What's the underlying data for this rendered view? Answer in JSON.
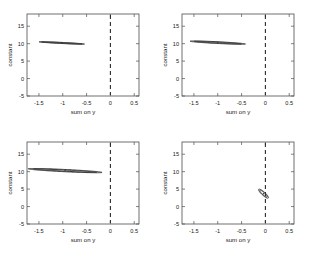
{
  "figure": {
    "title": "",
    "background_color": "#ffffff",
    "layout": "2x2 grid of confidence-ellipse scatter panels"
  },
  "chart_data": [
    {
      "type": "scatter",
      "panel": "top-left",
      "title": "",
      "xlabel": "sum on y",
      "ylabel": "constant",
      "xlim": [
        -1.75,
        0.6
      ],
      "ylim": [
        -5,
        18.5
      ],
      "xticks": [
        -1.5,
        -1,
        -0.5,
        0,
        0.5
      ],
      "xticklabels": [
        "-1.5",
        "-1",
        "-0.5",
        "0",
        "0.5"
      ],
      "yticks": [
        -5,
        0,
        5,
        10,
        15
      ],
      "yticklabels": [
        "-5",
        "0",
        "5",
        "10",
        "15"
      ],
      "grid": false,
      "legend": null,
      "annotations": [
        {
          "kind": "vertical-dashed-line",
          "x": 0,
          "label": "zero reference"
        }
      ],
      "ellipses": [
        {
          "name": "inner-contour",
          "cx": -1.02,
          "cy": 10.2,
          "semi_major": 0.52,
          "semi_minor": 0.075,
          "angle_deg": -36.0
        },
        {
          "name": "outer-contour",
          "cx": -1.02,
          "cy": 10.2,
          "semi_major": 0.58,
          "semi_minor": 0.13,
          "angle_deg": -36.0
        }
      ],
      "center_point": {
        "x": -1.02,
        "y": 10.2
      }
    },
    {
      "type": "scatter",
      "panel": "top-right",
      "title": "",
      "xlabel": "sum on y",
      "ylabel": "constant",
      "xlim": [
        -1.75,
        0.6
      ],
      "ylim": [
        -5,
        18.5
      ],
      "xticks": [
        -1.5,
        -1,
        -0.5,
        0,
        0.5
      ],
      "xticklabels": [
        "-1.5",
        "-1",
        "-0.5",
        "0",
        "0.5"
      ],
      "yticks": [
        -5,
        0,
        5,
        10,
        15
      ],
      "yticklabels": [
        "-5",
        "0",
        "5",
        "10",
        "15"
      ],
      "grid": false,
      "legend": null,
      "annotations": [
        {
          "kind": "vertical-dashed-line",
          "x": 0,
          "label": "zero reference"
        }
      ],
      "ellipses": [
        {
          "name": "inner-contour",
          "cx": -1.0,
          "cy": 10.3,
          "semi_major": 0.62,
          "semi_minor": 0.11,
          "angle_deg": -38.0
        },
        {
          "name": "outer-contour",
          "cx": -1.0,
          "cy": 10.3,
          "semi_major": 0.72,
          "semi_minor": 0.2,
          "angle_deg": -38.0
        }
      ],
      "center_point": {
        "x": -1.0,
        "y": 10.3
      }
    },
    {
      "type": "scatter",
      "panel": "bottom-left",
      "title": "",
      "xlabel": "sum on y",
      "ylabel": "constant",
      "xlim": [
        -1.75,
        0.6
      ],
      "ylim": [
        -5,
        18.5
      ],
      "xticks": [
        -1.5,
        -1,
        -0.5,
        0,
        0.5
      ],
      "xticklabels": [
        "-1.5",
        "-1",
        "-0.5",
        "0",
        "0.5"
      ],
      "yticks": [
        -5,
        0,
        5,
        10,
        15
      ],
      "yticklabels": [
        "-5",
        "0",
        "5",
        "10",
        "15"
      ],
      "grid": false,
      "legend": null,
      "annotations": [
        {
          "kind": "vertical-dashed-line",
          "x": 0,
          "label": "zero reference"
        }
      ],
      "ellipses": [
        {
          "name": "inner-contour",
          "cx": -0.95,
          "cy": 10.3,
          "semi_major": 0.82,
          "semi_minor": 0.14,
          "angle_deg": -37.0
        },
        {
          "name": "outer-contour",
          "cx": -0.95,
          "cy": 10.3,
          "semi_major": 0.95,
          "semi_minor": 0.26,
          "angle_deg": -37.0
        }
      ],
      "center_point": {
        "x": -0.95,
        "y": 10.3
      }
    },
    {
      "type": "scatter",
      "panel": "bottom-right",
      "title": "",
      "xlabel": "sum on y",
      "ylabel": "constant",
      "xlim": [
        -1.75,
        0.6
      ],
      "ylim": [
        -5,
        18.5
      ],
      "xticks": [
        -1.5,
        -1,
        -0.5,
        0,
        0.5
      ],
      "xticklabels": [
        "-1.5",
        "-1",
        "-0.5",
        "0",
        "0.5"
      ],
      "yticks": [
        -5,
        0,
        5,
        10,
        15
      ],
      "yticklabels": [
        "-5",
        "0",
        "5",
        "10",
        "15"
      ],
      "grid": false,
      "legend": null,
      "annotations": [
        {
          "kind": "vertical-dashed-line",
          "x": 0,
          "label": "zero reference"
        }
      ],
      "ellipses": [
        {
          "name": "inner-contour",
          "cx": -0.04,
          "cy": 3.7,
          "semi_major": 1.0,
          "semi_minor": 0.035,
          "angle_deg": -86.0
        },
        {
          "name": "outer-contour",
          "cx": -0.04,
          "cy": 3.7,
          "semi_major": 1.3,
          "semi_minor": 0.05,
          "angle_deg": -86.0
        }
      ],
      "center_point": {
        "x": -0.04,
        "y": 3.7
      }
    }
  ]
}
